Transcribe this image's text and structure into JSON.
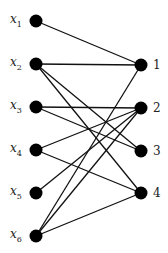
{
  "diagram": {
    "type": "bipartite-graph",
    "left_nodes": [
      {
        "id": "x1",
        "base": "x",
        "sub": "1",
        "x": 36,
        "y": 21
      },
      {
        "id": "x2",
        "base": "x",
        "sub": "2",
        "x": 36,
        "y": 64
      },
      {
        "id": "x3",
        "base": "x",
        "sub": "3",
        "x": 36,
        "y": 107
      },
      {
        "id": "x4",
        "base": "x",
        "sub": "4",
        "x": 36,
        "y": 150
      },
      {
        "id": "x5",
        "base": "x",
        "sub": "5",
        "x": 36,
        "y": 193
      },
      {
        "id": "x6",
        "base": "x",
        "sub": "6",
        "x": 36,
        "y": 236
      }
    ],
    "right_nodes": [
      {
        "id": "1",
        "label": "1",
        "x": 141,
        "y": 65
      },
      {
        "id": "2",
        "label": "2",
        "x": 141,
        "y": 108
      },
      {
        "id": "3",
        "label": "3",
        "x": 141,
        "y": 151
      },
      {
        "id": "4",
        "label": "4",
        "x": 141,
        "y": 193
      }
    ],
    "edges": [
      [
        "x1",
        "1"
      ],
      [
        "x2",
        "1"
      ],
      [
        "x2",
        "3"
      ],
      [
        "x2",
        "4"
      ],
      [
        "x3",
        "2"
      ],
      [
        "x3",
        "3"
      ],
      [
        "x4",
        "2"
      ],
      [
        "x4",
        "4"
      ],
      [
        "x5",
        "2"
      ],
      [
        "x6",
        "1"
      ],
      [
        "x6",
        "2"
      ],
      [
        "x6",
        "4"
      ]
    ],
    "node_color": "#000000",
    "edge_color": "#111111"
  }
}
